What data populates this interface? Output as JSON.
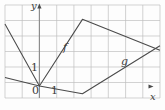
{
  "figure": {
    "background_color": "#fdfdfd",
    "grid_color": "#bfbfbf",
    "axis_color": "#8a8a8a",
    "curve_color": "#4a4a4a",
    "text_color": "#3b3b3b"
  },
  "axes": {
    "x_label": "x",
    "y_label": "y",
    "x_axis_pixel_y": 86,
    "y_axis_pixel_x": 39,
    "x_arrow": "right-arrow",
    "y_arrow": "up-arrow"
  },
  "ticks": {
    "origin_label": "0",
    "x_one_label": "1",
    "y_one_label": "1"
  },
  "curve_labels": {
    "f": "f",
    "g": "g"
  },
  "chart_data": {
    "type": "line",
    "xlabel": "x",
    "ylabel": "y",
    "grid": true,
    "legend": "inline-curve-labels",
    "xlim": [
      -2,
      7
    ],
    "ylim": [
      -1,
      5
    ],
    "x_ticks": [
      0,
      1
    ],
    "y_ticks": [
      1
    ],
    "grid_spacing": 1,
    "series": [
      {
        "name": "f",
        "label": "f",
        "label_position": [
          1.5,
          2.4
        ],
        "points": [
          [
            -2,
            4.0
          ],
          [
            0,
            0.0
          ],
          [
            2.5,
            4.3
          ],
          [
            7,
            2.3
          ]
        ]
      },
      {
        "name": "g",
        "label": "g",
        "label_position": [
          4.9,
          1.5
        ],
        "points": [
          [
            -2,
            0.55
          ],
          [
            0,
            0.0
          ],
          [
            2.5,
            -0.5
          ],
          [
            7,
            2.6
          ]
        ]
      }
    ]
  }
}
